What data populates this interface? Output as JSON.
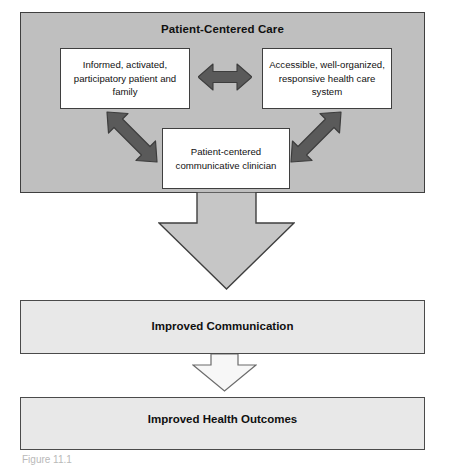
{
  "figure": {
    "type": "flow-diagram",
    "caption": "Figure 11.1"
  },
  "panel": {
    "title": "Patient-Centered Care",
    "fill_color": "#bfbfbf",
    "border_color": "#3f3f3f"
  },
  "boxes": [
    {
      "id": "patient",
      "label": "Informed, activated, participatory patient and family",
      "fill_color": "#ffffff"
    },
    {
      "id": "system",
      "label": "Accessible, well-organized, responsive health care system",
      "fill_color": "#ffffff"
    },
    {
      "id": "clinician",
      "label": "Patient-centered communicative clinician",
      "fill_color": "#ffffff"
    }
  ],
  "connectors": [
    {
      "id": "patient-system",
      "icon": "double-arrow-horizontal-icon",
      "direction": "bidirectional",
      "color": "#5a5a5a"
    },
    {
      "id": "patient-clinician",
      "icon": "double-arrow-diagonal-nwse-icon",
      "direction": "bidirectional",
      "color": "#5a5a5a"
    },
    {
      "id": "system-clinician",
      "icon": "double-arrow-diagonal-nesw-icon",
      "direction": "bidirectional",
      "color": "#5a5a5a"
    },
    {
      "id": "care-to-communication",
      "icon": "block-arrow-down-icon",
      "direction": "down",
      "color": "#c6c6c6"
    },
    {
      "id": "communication-to-outcomes",
      "icon": "block-arrow-down-icon",
      "direction": "down",
      "color": "#f2f2f2"
    }
  ],
  "bars": [
    {
      "id": "communication",
      "label": "Improved Communication",
      "fill_color": "#e8e8e8"
    },
    {
      "id": "outcomes",
      "label": "Improved Health Outcomes",
      "fill_color": "#e8e8e8"
    }
  ]
}
